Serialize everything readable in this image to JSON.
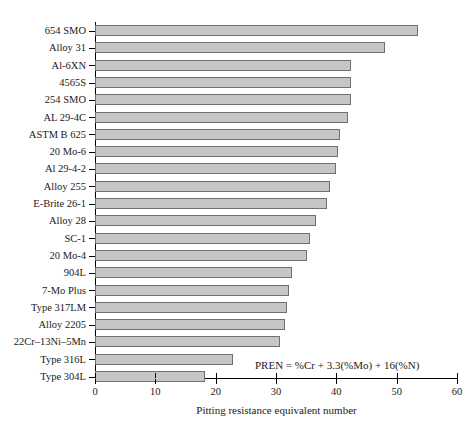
{
  "chart_data": {
    "type": "bar",
    "orientation": "horizontal",
    "title": "",
    "xlabel": "Pitting resistance equivalent number",
    "ylabel": "",
    "xlim": [
      0,
      60
    ],
    "xticks": [
      0,
      10,
      20,
      30,
      40,
      50,
      60
    ],
    "grid": false,
    "legend": null,
    "annotations": [
      "PREN = %Cr + 3.3(%Mo) + 16(%N)"
    ],
    "categories": [
      "654 SMO",
      "Alloy 31",
      "Al-6XN",
      "4565S",
      "254 SMO",
      "AL 29-4C",
      "ASTM B 625",
      "20 Mo-6",
      "Al 29-4-2",
      "Alloy 255",
      "E-Brite 26-1",
      "Alloy 28",
      "SC-1",
      "20 Mo-4",
      "904L",
      "7-Mo Plus",
      "Type 317LM",
      "Alloy 2205",
      "22Cr–13Ni–5Mn",
      "Type 316L",
      "Type 304L"
    ],
    "values": [
      53.6,
      48.0,
      42.5,
      42.5,
      42.4,
      42.0,
      40.6,
      40.2,
      39.9,
      38.9,
      38.4,
      36.6,
      35.6,
      35.1,
      32.7,
      32.2,
      31.9,
      31.5,
      30.7,
      22.9,
      18.2
    ],
    "bar_color": "#c4c7c4",
    "bar_edge_color": "#6e726e"
  },
  "axis": {
    "tick_labels": [
      "0",
      "10",
      "20",
      "30",
      "40",
      "50",
      "60"
    ],
    "title": "Pitting resistance equivalent number"
  },
  "annotation": {
    "pren_formula": "PREN = %Cr + 3.3(%Mo) + 16(%N)"
  }
}
